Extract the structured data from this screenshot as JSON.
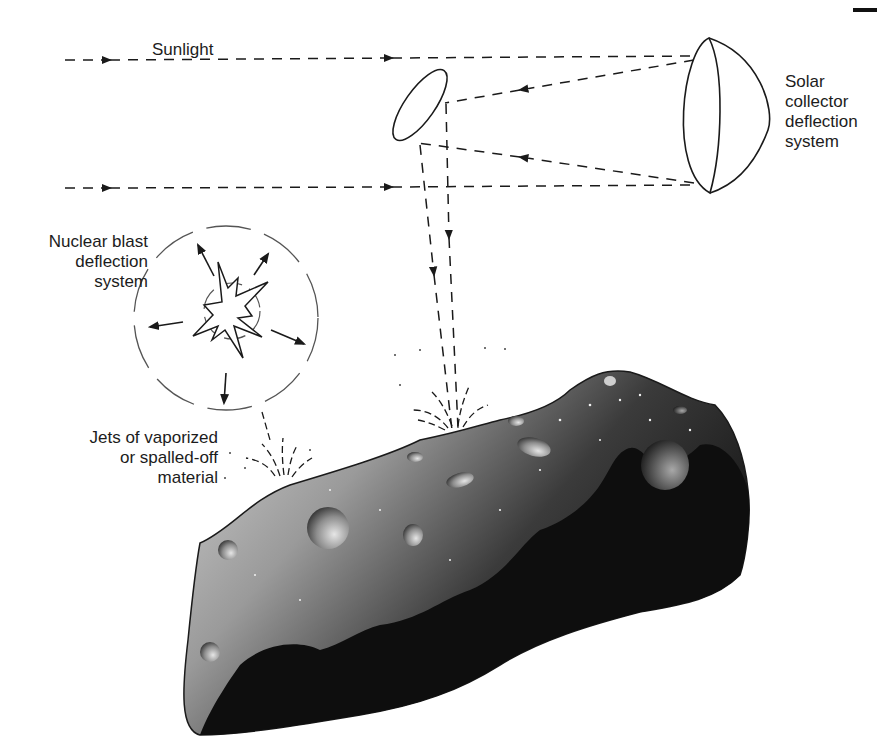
{
  "diagram": {
    "type": "asteroid-deflection-illustration",
    "labels": {
      "sunlight": "Sunlight",
      "solar_collector": "Solar\ncollector\ndeflection\nsystem",
      "nuclear_blast": "Nuclear blast\ndeflection\nsystem",
      "jets": "Jets of vaporized\nor spalled-off\nmaterial"
    },
    "elements": [
      {
        "id": "sunlight-ray-top",
        "kind": "dashed-arrow",
        "from": [
          65,
          60
        ],
        "to": [
          695,
          57
        ]
      },
      {
        "id": "sunlight-ray-bottom",
        "kind": "dashed-arrow",
        "from": [
          65,
          188
        ],
        "to": [
          695,
          186
        ]
      },
      {
        "id": "solar-collector-mirror",
        "kind": "hemisphere",
        "center": [
          712,
          118
        ]
      },
      {
        "id": "secondary-mirror",
        "kind": "ellipse",
        "center": [
          418,
          105
        ]
      },
      {
        "id": "reflected-beams",
        "kind": "dashed-arrows-down",
        "targets": [
          [
            455,
            432
          ]
        ]
      },
      {
        "id": "nuclear-blast",
        "kind": "starburst-with-arrows",
        "center": [
          238,
          305
        ],
        "radius": 90
      },
      {
        "id": "asteroid",
        "kind": "cratered-body"
      },
      {
        "id": "ejecta-jet-left",
        "kind": "spray",
        "at": [
          285,
          482
        ]
      },
      {
        "id": "ejecta-jet-right",
        "kind": "spray",
        "at": [
          455,
          428
        ]
      }
    ],
    "colors": {
      "line": "#1a1a1a",
      "asteroid_light": "#bdbdbd",
      "asteroid_dark": "#0c0c0c",
      "background": "#ffffff"
    }
  }
}
